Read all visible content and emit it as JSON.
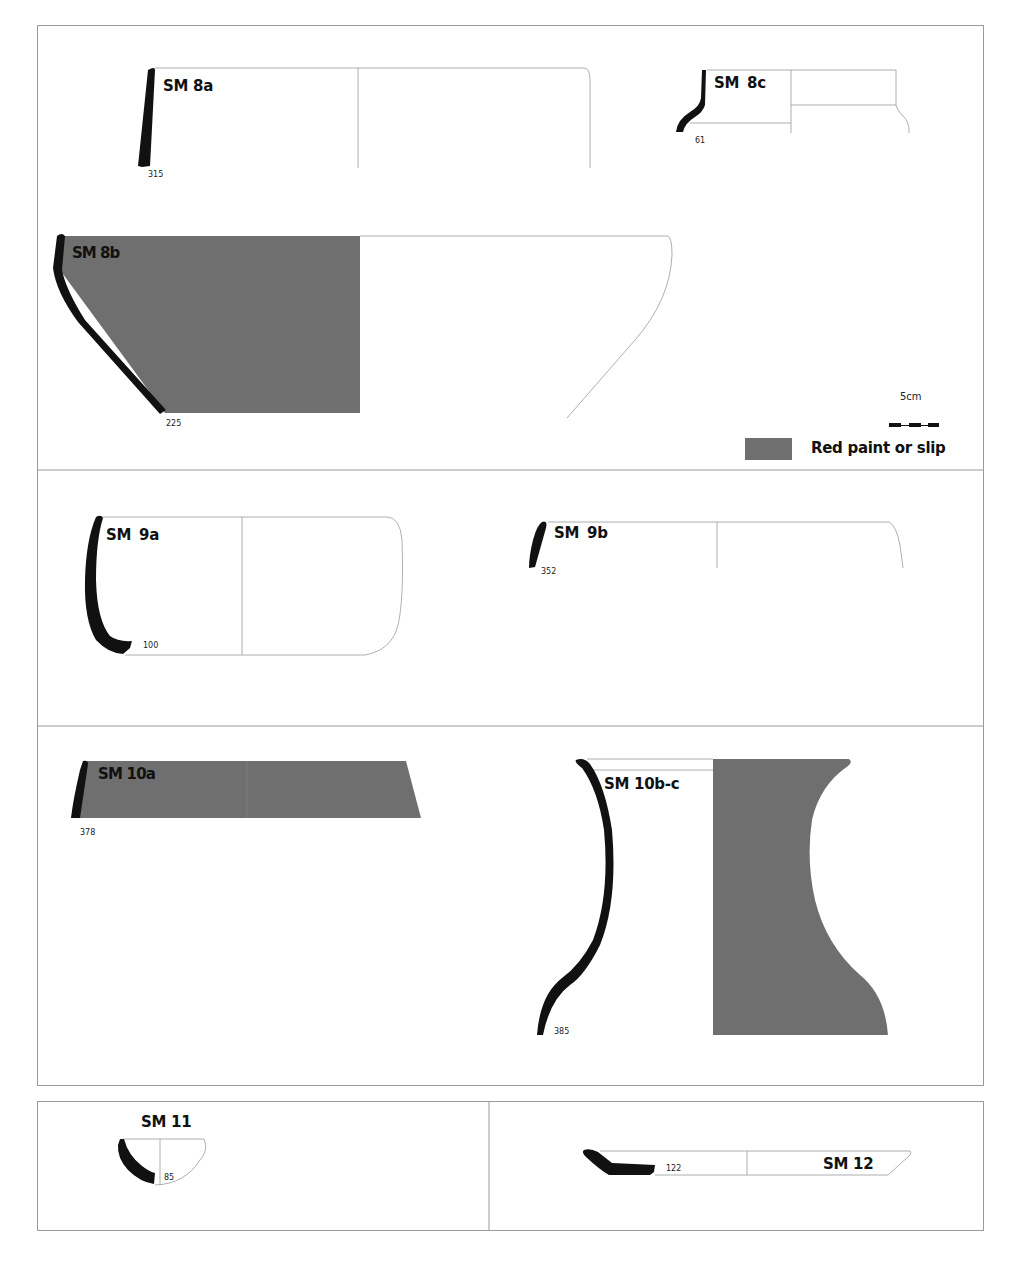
{
  "figure": {
    "colors": {
      "section_fill": "#111111",
      "paint_fill": "#6f6f6f",
      "outline": "#9a9a9a",
      "frame": "#9a9a9a"
    },
    "vessels": [
      {
        "id": "SM 8a",
        "number": "315",
        "painted": false
      },
      {
        "id": "SM 8c",
        "number": "61",
        "painted": false
      },
      {
        "id": "SM 8b",
        "number": "225",
        "painted": true
      },
      {
        "id": "SM 9a",
        "number": "100",
        "painted": false
      },
      {
        "id": "SM 9b",
        "number": "352",
        "painted": false
      },
      {
        "id": "SM 10a",
        "number": "378",
        "painted": true
      },
      {
        "id": "SM 10b-c",
        "number": "385",
        "painted": true
      },
      {
        "id": "SM 11",
        "number": "85",
        "painted": false
      },
      {
        "id": "SM 12",
        "number": "122",
        "painted": false
      }
    ],
    "scale_bar": {
      "label": "5cm"
    },
    "legend": {
      "label": "Red paint or slip",
      "swatch_color": "#6f6f6f"
    }
  }
}
